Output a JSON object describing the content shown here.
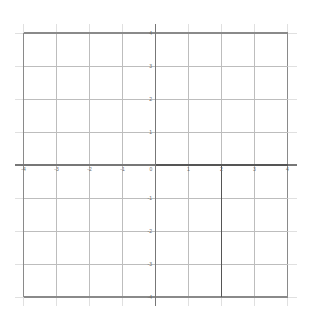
{
  "figure": {
    "title": "",
    "background_color": "#ffffff",
    "width": 321,
    "height": 321
  },
  "chart_data": {
    "type": "line",
    "title": "",
    "xlabel": "",
    "ylabel": "",
    "xlim": [
      -4,
      4
    ],
    "ylim": [
      -4,
      4
    ],
    "grid": true,
    "legend": null,
    "x_ticks": [
      -4,
      -3,
      -2,
      -1,
      0,
      1,
      2,
      3,
      4
    ],
    "y_ticks": [
      -4,
      -3,
      -2,
      -1,
      0,
      1,
      2,
      3,
      4
    ],
    "x_tick_labels": [
      "-4",
      "-3",
      "-2",
      "-1",
      "0",
      "1",
      "2",
      "3",
      "4"
    ],
    "y_tick_labels": [
      "4",
      "3",
      "2",
      "1",
      "0",
      "-1",
      "-2",
      "-3",
      "-4"
    ],
    "series": [
      {
        "name": "horizontal-segment",
        "type": "line",
        "points": [
          [
            0,
            0
          ],
          [
            4,
            0
          ]
        ],
        "color": "#555555",
        "width": 1.4
      },
      {
        "name": "vertical-segment",
        "type": "line",
        "points": [
          [
            2,
            0
          ],
          [
            2,
            -4
          ]
        ],
        "color": "#555555",
        "width": 1.4
      }
    ],
    "annotations": []
  },
  "axes": {
    "x_axis_label": "",
    "y_axis_label": "",
    "x_axis_color": "#777777",
    "y_axis_color": "#777777",
    "gridline_color": "#bdbdbd",
    "gridline_color_minor": "#d6d6d6",
    "border_color": "#8a8a8a",
    "tick_label_color": "#6b6b6b",
    "emphasis_color": "#555555"
  },
  "geometry": {
    "origin_x": 155.5,
    "origin_y": 165.0,
    "unit_px": 33.0,
    "overhang_px": 9
  },
  "x_tick_positions": [
    {
      "value": -4,
      "label": "-4",
      "px": 23.5
    },
    {
      "value": -3,
      "label": "-3",
      "px": 56.5
    },
    {
      "value": -2,
      "label": "-2",
      "px": 89.5
    },
    {
      "value": -1,
      "label": "-1",
      "px": 122.5
    },
    {
      "value": 0,
      "label": "0",
      "px": 155.5
    },
    {
      "value": 1,
      "label": "1",
      "px": 188.5
    },
    {
      "value": 2,
      "label": "2",
      "px": 221.5
    },
    {
      "value": 3,
      "label": "3",
      "px": 254.5
    },
    {
      "value": 4,
      "label": "4",
      "px": 287.5
    }
  ],
  "y_tick_positions": [
    {
      "value": 4,
      "label": "4",
      "px": 33.0
    },
    {
      "value": 3,
      "label": "3",
      "px": 66.0
    },
    {
      "value": 2,
      "label": "2",
      "px": 99.0
    },
    {
      "value": 1,
      "label": "1",
      "px": 132.0
    },
    {
      "value": 0,
      "label": "0",
      "px": 165.0
    },
    {
      "value": -1,
      "label": "-1",
      "px": 198.0
    },
    {
      "value": -2,
      "label": "-2",
      "px": 231.0
    },
    {
      "value": -3,
      "label": "-3",
      "px": 264.0
    },
    {
      "value": -4,
      "label": "-4",
      "px": 297.0
    }
  ]
}
